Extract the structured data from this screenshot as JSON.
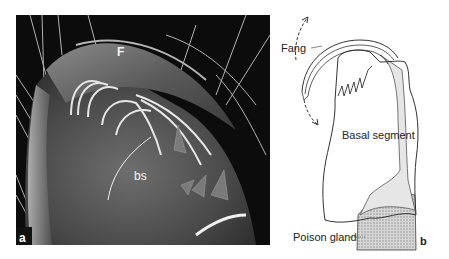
{
  "figure": {
    "panel_a": {
      "panel_letter": "a",
      "type": "SEM micrograph",
      "labels": {
        "fang": "F",
        "basal_segment": "bs"
      }
    },
    "panel_b": {
      "panel_letter": "b",
      "type": "line drawing",
      "labels": {
        "fang": "Fang",
        "basal_segment": "Basal segment",
        "poison_gland": "Poison gland"
      }
    },
    "colors": {
      "photo_background": "#0c0c0c",
      "outline": "#333333",
      "duct_fill": "#e6e6e6",
      "gland_fill": "#bdbdbd"
    }
  }
}
